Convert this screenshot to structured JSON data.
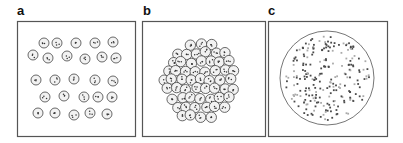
{
  "figure": {
    "panels": [
      {
        "id": "a",
        "label": "a",
        "description": "Dispersed particles arranged loosely in rows",
        "box": {
          "x": 17,
          "y": 21,
          "w": 118,
          "h": 115
        }
      },
      {
        "id": "b",
        "label": "b",
        "description": "Densely clustered aggregate of particles",
        "box": {
          "x": 142,
          "y": 21,
          "w": 123,
          "h": 115
        }
      },
      {
        "id": "c",
        "label": "c",
        "description": "Large circle containing many small dark and light dots",
        "box": {
          "x": 268,
          "y": 21,
          "w": 119,
          "h": 115
        }
      }
    ],
    "colors": {
      "border": "#555555",
      "particle_stroke": "#444444",
      "particle_fill": "#f2f2f2",
      "dot_dark": "#4a4a4a",
      "dot_light": "#aaaaaa",
      "big_circle_stroke": "#666666"
    },
    "panel_a_particles": [
      [
        44,
        43
      ],
      [
        57,
        43
      ],
      [
        76,
        43
      ],
      [
        95,
        43
      ],
      [
        113,
        42
      ],
      [
        33,
        55
      ],
      [
        48,
        58
      ],
      [
        67,
        56
      ],
      [
        85,
        59
      ],
      [
        102,
        57
      ],
      [
        116,
        58
      ],
      [
        36,
        80
      ],
      [
        55,
        80
      ],
      [
        74,
        79
      ],
      [
        95,
        80
      ],
      [
        113,
        81
      ],
      [
        45,
        97
      ],
      [
        64,
        96
      ],
      [
        84,
        97
      ],
      [
        98,
        97
      ],
      [
        112,
        97
      ],
      [
        38,
        113
      ],
      [
        55,
        113
      ],
      [
        74,
        115
      ],
      [
        90,
        113
      ],
      [
        107,
        114
      ]
    ],
    "panel_c_circle": {
      "cx": 327,
      "cy": 78,
      "r": 47
    }
  }
}
